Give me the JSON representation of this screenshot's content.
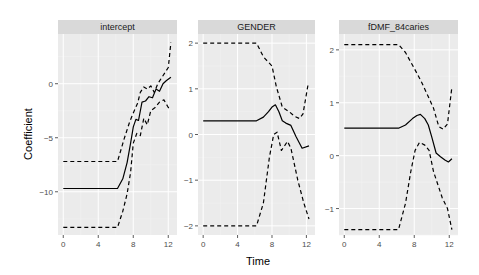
{
  "chart_data": {
    "type": "line",
    "layout": "facet_wrap",
    "xlabel": "Time",
    "ylabel": "Coefficient",
    "grid": true,
    "legend": null,
    "panels": [
      {
        "title": "intercept",
        "xlim": [
          -0.6,
          13.0
        ],
        "ylim": [
          -14.0,
          4.6
        ],
        "xticks": [
          0,
          4,
          8,
          12
        ],
        "yticks": [
          0,
          -5,
          -10
        ],
        "series": [
          {
            "name": "estimate",
            "style": "solid",
            "x": [
              0,
              6.2,
              6.8,
              7.3,
              7.7,
              8.0,
              8.3,
              8.6,
              9.0,
              9.4,
              9.8,
              10.2,
              10.6,
              11.0,
              11.4,
              11.8,
              12.3
            ],
            "y": [
              -9.7,
              -9.7,
              -8.8,
              -7.3,
              -5.5,
              -4.0,
              -3.3,
              -3.4,
              -1.7,
              -1.6,
              -1.2,
              -1.3,
              -0.5,
              -0.7,
              0.0,
              0.3,
              0.6
            ]
          },
          {
            "name": "upper",
            "style": "dashed",
            "x": [
              0,
              6.2,
              7.0,
              7.6,
              8.0,
              8.5,
              8.8,
              9.2,
              9.6,
              10.0,
              10.4,
              10.8,
              11.2,
              11.6,
              12.0,
              12.3
            ],
            "y": [
              -7.2,
              -7.2,
              -5.0,
              -3.5,
              -2.7,
              -1.8,
              -0.8,
              -0.3,
              -0.5,
              -0.2,
              -0.8,
              0.0,
              0.5,
              1.0,
              1.5,
              3.8
            ]
          },
          {
            "name": "lower",
            "style": "dashed",
            "x": [
              0,
              6.2,
              6.8,
              7.3,
              7.7,
              8.0,
              8.4,
              8.8,
              9.2,
              9.6,
              10.0,
              10.5,
              11.0,
              11.5,
              12.0,
              12.3
            ],
            "y": [
              -13.3,
              -13.3,
              -11.8,
              -10.2,
              -8.2,
              -5.5,
              -4.6,
              -4.8,
              -3.2,
              -3.8,
              -2.5,
              -2.2,
              -1.7,
              -1.5,
              -2.2,
              -2.4
            ]
          }
        ]
      },
      {
        "title": "GENDER",
        "xlim": [
          -0.6,
          13.0
        ],
        "ylim": [
          -2.2,
          2.2
        ],
        "xticks": [
          0,
          4,
          8,
          12
        ],
        "yticks": [
          2,
          1,
          0,
          -1,
          -2
        ],
        "series": [
          {
            "name": "estimate",
            "style": "solid",
            "x": [
              0,
              6.2,
              7.0,
              7.6,
              8.0,
              8.4,
              8.8,
              9.2,
              9.6,
              10.2,
              10.8,
              11.5,
              12.3
            ],
            "y": [
              0.3,
              0.3,
              0.38,
              0.5,
              0.6,
              0.65,
              0.5,
              0.3,
              0.25,
              0.2,
              -0.05,
              -0.3,
              -0.25
            ]
          },
          {
            "name": "upper",
            "style": "dashed",
            "x": [
              0,
              6.2,
              7.0,
              8.0,
              8.5,
              9.2,
              10.0,
              10.6,
              11.2,
              11.6,
              12.2
            ],
            "y": [
              2.0,
              2.0,
              1.7,
              1.5,
              1.05,
              0.6,
              0.5,
              0.4,
              0.35,
              0.45,
              1.1
            ]
          },
          {
            "name": "lower",
            "style": "dashed",
            "x": [
              0,
              6.2,
              7.0,
              7.7,
              8.2,
              8.6,
              9.1,
              9.8,
              10.2,
              11.0,
              11.7,
              12.3
            ],
            "y": [
              -2.0,
              -2.0,
              -1.5,
              -0.5,
              0.0,
              0.05,
              -0.35,
              -0.15,
              -0.3,
              -1.0,
              -1.5,
              -1.85
            ]
          }
        ]
      },
      {
        "title": "fDMF_84caries",
        "xlim": [
          -0.6,
          13.0
        ],
        "ylim": [
          -1.5,
          2.3
        ],
        "xticks": [
          0,
          4,
          8,
          12
        ],
        "yticks": [
          2,
          1,
          0,
          -1
        ],
        "series": [
          {
            "name": "estimate",
            "style": "solid",
            "x": [
              0,
              6.2,
              7.0,
              7.8,
              8.3,
              8.7,
              9.2,
              9.6,
              10.0,
              10.5,
              11.0,
              11.5,
              11.9,
              12.3
            ],
            "y": [
              0.52,
              0.52,
              0.58,
              0.7,
              0.76,
              0.78,
              0.7,
              0.58,
              0.35,
              0.05,
              -0.02,
              -0.08,
              -0.12,
              -0.06
            ]
          },
          {
            "name": "upper",
            "style": "dashed",
            "x": [
              0,
              6.2,
              7.0,
              8.0,
              8.8,
              9.5,
              10.2,
              10.8,
              11.3,
              11.8,
              12.3
            ],
            "y": [
              2.1,
              2.1,
              1.95,
              1.65,
              1.4,
              1.15,
              0.9,
              0.55,
              0.5,
              0.6,
              1.3
            ]
          },
          {
            "name": "lower",
            "style": "dashed",
            "x": [
              0,
              6.2,
              7.0,
              7.6,
              8.1,
              8.6,
              9.2,
              9.7,
              10.2,
              11.2,
              11.8,
              12.3
            ],
            "y": [
              -1.4,
              -1.4,
              -0.9,
              -0.3,
              0.1,
              0.25,
              0.2,
              0.1,
              -0.3,
              -0.8,
              -1.0,
              -1.4
            ]
          }
        ]
      }
    ]
  },
  "axis": {
    "x_title": "Time",
    "y_title": "Coefficient"
  },
  "colors": {
    "panel_bg": "#ebebeb",
    "strip_bg": "#d9d9d9",
    "grid_major": "#ffffff",
    "grid_minor": "#f2f2f2",
    "line": "#000000",
    "tick_text": "#4d4d4d"
  }
}
